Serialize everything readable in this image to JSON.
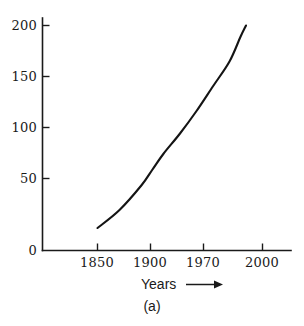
{
  "chart_data": {
    "type": "line",
    "title": "",
    "subtitle": "",
    "xlabel": "Years",
    "ylabel": "",
    "xlim": [
      1820,
      2015
    ],
    "ylim": [
      0,
      210
    ],
    "grid": false,
    "legend": null,
    "x_tick_labels": [
      "1850",
      "1900",
      "1970",
      "2000"
    ],
    "x_ticks": [
      1850,
      1900,
      1970,
      2000
    ],
    "y_tick_labels": [
      "0",
      "50",
      "100",
      "150",
      "200"
    ],
    "y_ticks": [
      0,
      50,
      100,
      150,
      200
    ],
    "series": [
      {
        "name": "growth-curve",
        "color": "#141414",
        "x": [
          1850,
          1870,
          1890,
          1900,
          1910,
          1925,
          1940,
          1955,
          1970,
          1980,
          1985
        ],
        "y": [
          20,
          36,
          58,
          72,
          86,
          104,
          124,
          146,
          168,
          190,
          200
        ]
      }
    ],
    "annotations": [
      {
        "name": "x-axis-arrow",
        "text": "",
        "direction": "right"
      },
      {
        "name": "panel-caption",
        "text": "(a)"
      }
    ],
    "caption": "(a)"
  },
  "figure": {
    "caption": "(a)",
    "axis_title_x": "Years",
    "arrow_icon": "right-arrow-icon",
    "ink_color": "#1a1a1a",
    "background_color": "#ffffff"
  }
}
